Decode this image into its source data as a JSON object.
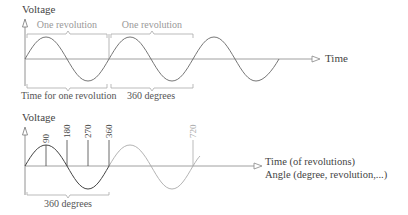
{
  "top": {
    "y_label": "Voltage",
    "x_label": "Time",
    "bracket_labels": [
      "One revolution",
      "One revolution"
    ],
    "bottom_labels": [
      "Time for one revolution",
      "360 degrees"
    ]
  },
  "bottom": {
    "y_label": "Voltage",
    "x_label_line1": "Time (of revolutions)",
    "x_label_line2": "Angle (degree, revolution,...)",
    "ticks": [
      "90",
      "180",
      "270",
      "360",
      "720"
    ],
    "bracket_label": "360 degrees"
  },
  "colors": {
    "dark": "#555555",
    "mid": "#777777",
    "light": "#aaaaaa"
  }
}
